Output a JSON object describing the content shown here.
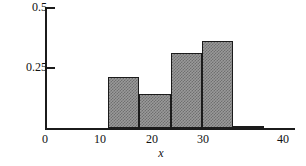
{
  "chart_data": {
    "type": "bar",
    "title": "",
    "subtitle": "",
    "xlabel": "x",
    "ylabel": "",
    "xlim": [
      0,
      40
    ],
    "ylim": [
      0,
      0.5
    ],
    "grid": false,
    "legend": null,
    "x_ticks": [
      "0",
      "10",
      "20",
      "30",
      "40"
    ],
    "x_tick_values": [
      0,
      10,
      20,
      30,
      40
    ],
    "y_ticks": [
      "0.25",
      "0.5"
    ],
    "y_tick_values": [
      0.25,
      0.5
    ],
    "bin_width": 5,
    "categories": [
      "10-15",
      "15-20",
      "20-25",
      "25-30",
      "30-35"
    ],
    "bin_edges": [
      10,
      15,
      20,
      25,
      30,
      35
    ],
    "values": [
      0.21,
      0.14,
      0.31,
      0.36,
      0.01
    ],
    "series": [
      {
        "name": "relative frequency",
        "values": [
          0.21,
          0.14,
          0.31,
          0.36,
          0.01
        ]
      }
    ],
    "bars": [
      {
        "label": "10-15",
        "x0": 10,
        "x1": 15,
        "value": 0.21
      },
      {
        "label": "15-20",
        "x0": 15,
        "x1": 20,
        "value": 0.14
      },
      {
        "label": "20-25",
        "x0": 20,
        "x1": 25,
        "value": 0.31
      },
      {
        "label": "25-30",
        "x0": 25,
        "x1": 30,
        "value": 0.36
      },
      {
        "label": "30-35",
        "x0": 30,
        "x1": 35,
        "value": 0.01
      }
    ],
    "colors": {
      "bar_fill": "#9a9a9a",
      "bar_hatch": "#6f6f6f",
      "bar_edge": "#1b1b1b",
      "axis": "#1b1b1b",
      "text": "#111111",
      "background": "#ffffff"
    }
  },
  "axes": {
    "y_label_top": "0.5",
    "y_label_mid": "0.25",
    "x_label_0": "0",
    "x_label_10": "10",
    "x_label_20": "20",
    "x_label_30": "30",
    "x_label_40": "40",
    "x_title": "x"
  }
}
